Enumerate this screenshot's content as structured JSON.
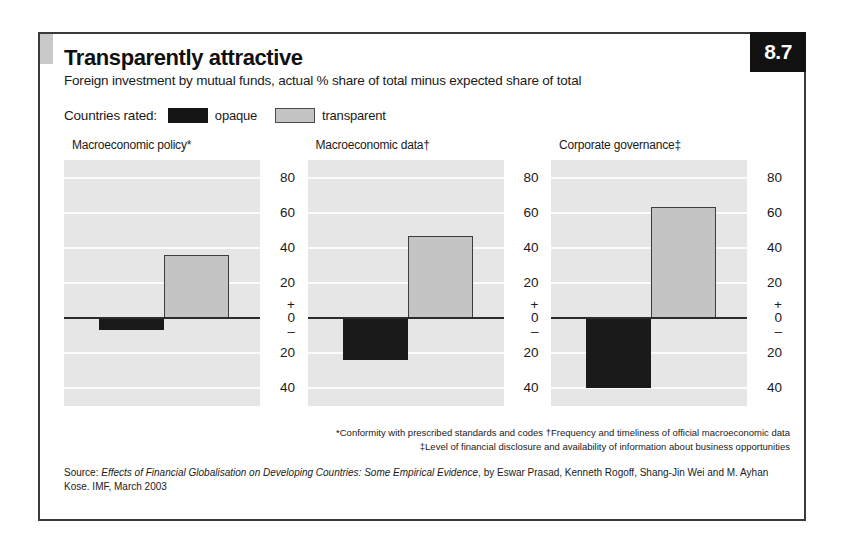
{
  "figure": {
    "number": "8.7",
    "title": "Transparently attractive",
    "subtitle": "Foreign investment by mutual funds, actual % share of total minus expected share of total"
  },
  "legend": {
    "label": "Countries rated:",
    "entries": [
      {
        "key": "opaque",
        "text": "opaque",
        "color": "#151515"
      },
      {
        "key": "transparent",
        "text": "transparent",
        "color": "#c4c4c4"
      }
    ]
  },
  "axis": {
    "ticks": [
      "80",
      "60",
      "40",
      "20",
      "0",
      "20",
      "40"
    ],
    "plus_sign": "+",
    "minus_sign": "–"
  },
  "panels": [
    {
      "title": "Macroeconomic policy*",
      "opaque": -7,
      "transparent": 36
    },
    {
      "title": "Macroeconomic data†",
      "opaque": -24,
      "transparent": 47
    },
    {
      "title": "Corporate governance‡",
      "opaque": -40,
      "transparent": 63
    }
  ],
  "footnotes": [
    "*Conformity with prescribed standards and codes   †Frequency and timeliness of official macroeconomic data",
    "‡Level of financial disclosure and availability of information about business opportunities"
  ],
  "source": {
    "prefix": "Source: ",
    "title_italic": "Effects of Financial Globalisation on Developing Countries: Some Empirical Evidence",
    "rest": ", by Eswar Prasad, Kenneth Rogoff, Shang-Jin Wei and M. Ayhan Kose. IMF, March 2003"
  },
  "chart_data": {
    "type": "bar",
    "title": "Transparently attractive",
    "subtitle": "Foreign investment by mutual funds, actual % share of total minus expected share of total",
    "xlabel": "",
    "ylabel": "",
    "ylim": [
      -50,
      90
    ],
    "yticks": [
      -40,
      -20,
      0,
      20,
      40,
      60,
      80
    ],
    "grid": true,
    "legend_position": "top-left",
    "categories": [
      "Macroeconomic policy*",
      "Macroeconomic data†",
      "Corporate governance‡"
    ],
    "series": [
      {
        "name": "opaque",
        "color": "#151515",
        "values": [
          -7,
          -24,
          -40
        ]
      },
      {
        "name": "transparent",
        "color": "#c4c4c4",
        "values": [
          36,
          47,
          63
        ]
      }
    ],
    "notes": [
      "*Conformity with prescribed standards and codes",
      "†Frequency and timeliness of official macroeconomic data",
      "‡Level of financial disclosure and availability of information about business opportunities"
    ],
    "source": "Source: Effects of Financial Globalisation on Developing Countries: Some Empirical Evidence, by Eswar Prasad, Kenneth Rogoff, Shang-Jin Wei and M. Ayhan Kose. IMF, March 2003"
  }
}
